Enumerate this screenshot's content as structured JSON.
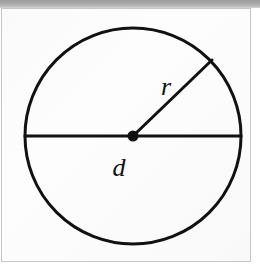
{
  "figure": {
    "labels": {
      "radius": "r",
      "diameter": "d"
    },
    "colors": {
      "stroke": "#111111",
      "page_background": "#fdfdfd",
      "frame_border": "#c6c6c6",
      "scan_band": "#a9a9a9"
    },
    "geometry": {
      "circle_center_x": 133,
      "circle_center_y": 136,
      "circle_radius": 108,
      "stroke_width": 3,
      "center_dot_radius": 5,
      "diameter_start_x": 25,
      "diameter_end_x": 241,
      "diameter_y": 136,
      "radius_end_x": 212,
      "radius_end_y": 60,
      "radius_label_x": 166,
      "radius_label_y": 95,
      "diameter_label_x": 119,
      "diameter_label_y": 176
    }
  }
}
